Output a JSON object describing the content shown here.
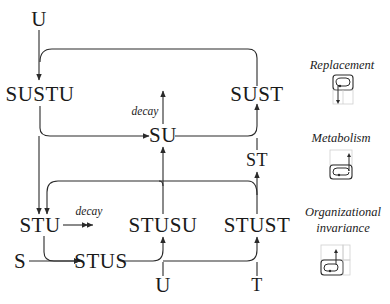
{
  "diagram": {
    "nodes": {
      "u_top": "U",
      "sustu": "SUSTU",
      "sust": "SUST",
      "su": "SU",
      "st": "ST",
      "stu": "STU",
      "stusu": "STUSU",
      "stust": "STUST",
      "s": "S",
      "stus": "STUS",
      "u_bottom": "U",
      "t": "T"
    },
    "edge_labels": {
      "decay_su": "decay",
      "decay_stu": "decay"
    }
  },
  "legend": {
    "items": [
      {
        "title": "Replacement",
        "icon": "replacement-icon"
      },
      {
        "title": "Metabolism",
        "icon": "metabolism-icon"
      },
      {
        "title_line1": "Organizational",
        "title_line2": "invariance",
        "icon": "organizational-invariance-icon"
      }
    ]
  },
  "colors": {
    "line": "#2a2a2a",
    "faint": "#c8c8c8",
    "text": "#1a1a1a"
  }
}
